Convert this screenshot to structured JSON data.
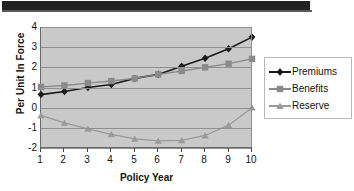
{
  "window": {
    "top_bar": "",
    "top_bar_color": "#222222"
  },
  "chart_data": {
    "type": "line",
    "title": "",
    "xlabel": "Policy Year",
    "ylabel": "Per Unit In Force",
    "x": [
      1,
      2,
      3,
      4,
      5,
      6,
      7,
      8,
      9,
      10
    ],
    "xtick_labels": [
      "1",
      "2",
      "3",
      "4",
      "5",
      "6",
      "7",
      "8",
      "9",
      "10"
    ],
    "ytick_labels": [
      "4",
      "3",
      "2",
      "1",
      "0",
      "-1",
      "-2"
    ],
    "ylim": [
      -2,
      4
    ],
    "xlim": [
      1,
      10
    ],
    "grid": true,
    "plot_background": "#c9c9c9",
    "legend_position": "right",
    "series": [
      {
        "name": "Premiums",
        "marker": "diamond",
        "color": "#1a1a1a",
        "values": [
          0.65,
          0.8,
          1.0,
          1.15,
          1.45,
          1.65,
          2.05,
          2.45,
          2.92,
          3.5
        ]
      },
      {
        "name": "Benefits",
        "marker": "square",
        "color": "#8a8a8a",
        "values": [
          1.03,
          1.1,
          1.22,
          1.32,
          1.45,
          1.65,
          1.82,
          2.0,
          2.18,
          2.42
        ]
      },
      {
        "name": "Reserve",
        "marker": "triangle",
        "color": "#9a9a9a",
        "values": [
          -0.38,
          -0.75,
          -1.05,
          -1.32,
          -1.55,
          -1.65,
          -1.62,
          -1.38,
          -0.87,
          0.0
        ]
      }
    ]
  }
}
